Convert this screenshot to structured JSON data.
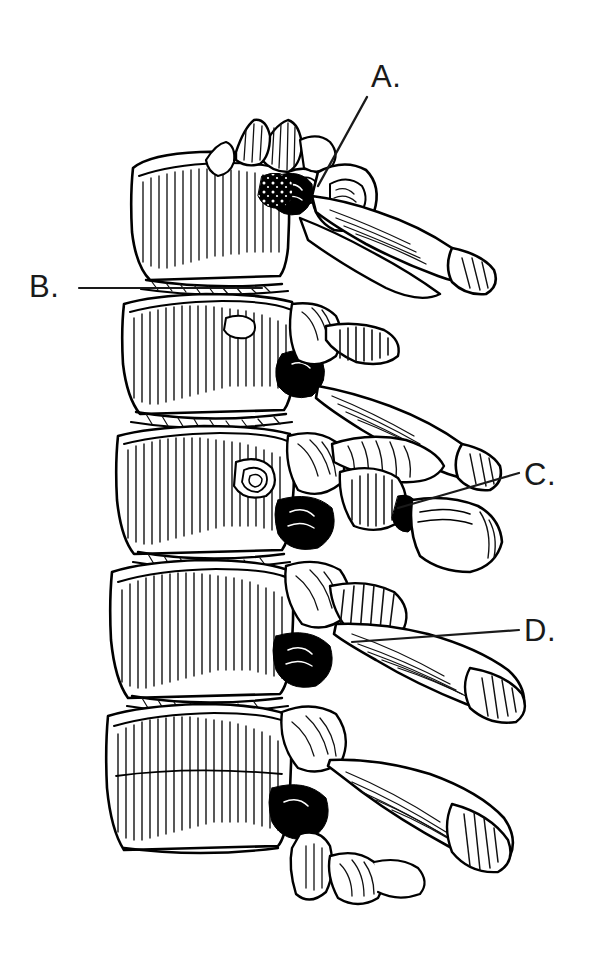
{
  "figure": {
    "view": "lateral",
    "style": "pen-and-ink line drawing",
    "background_color": "#ffffff",
    "ink_color": "#000000",
    "vertebra_count": 5
  },
  "labels": [
    {
      "id": "a",
      "text": "A.",
      "x": 371,
      "y": 61,
      "leader": {
        "from_x": 367,
        "from_y": 97,
        "to_x": 318,
        "to_y": 186,
        "style": "diagonal"
      }
    },
    {
      "id": "b",
      "text": "B.",
      "x": 29,
      "y": 271,
      "leader": {
        "from_x": 79,
        "from_y": 288,
        "to_x": 262,
        "to_y": 288,
        "style": "horizontal"
      }
    },
    {
      "id": "c",
      "text": "C.",
      "x": 524,
      "y": 459,
      "leader": {
        "from_x": 519,
        "from_y": 473,
        "to_x": 398,
        "to_y": 508,
        "style": "diagonal"
      }
    },
    {
      "id": "d",
      "text": "D.",
      "x": 524,
      "y": 615,
      "leader": {
        "from_x": 519,
        "from_y": 630,
        "to_x": 352,
        "to_y": 642,
        "style": "diagonal"
      }
    }
  ]
}
